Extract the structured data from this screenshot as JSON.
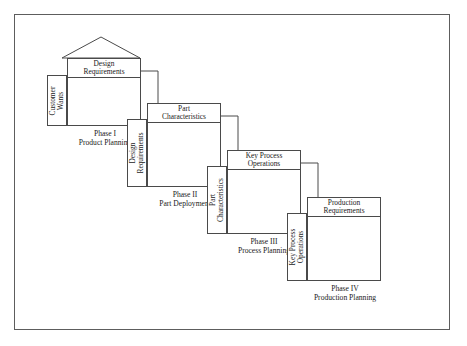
{
  "figure": {
    "border_color": "#5d5d5d",
    "line_color": "#4a4a4a",
    "background": "#ffffff",
    "text_color": "#1a1a1a"
  },
  "phases": [
    {
      "id": "phase-1",
      "output_label": "Design\nRequirements",
      "output_line1": "Design",
      "output_line2": "Requirements",
      "input_line1": "Customer",
      "input_line2": "Wants",
      "caption_line1": "Phase I",
      "caption_line2": "Product Planning",
      "has_roof": true
    },
    {
      "id": "phase-2",
      "output_label": "Part\nCharacteristics",
      "output_line1": "Part",
      "output_line2": "Characteristics",
      "input_line1": "Design",
      "input_line2": "Requirements",
      "caption_line1": "Phase II",
      "caption_line2": "Part Deployment",
      "has_roof": false
    },
    {
      "id": "phase-3",
      "output_label": "Key Process\nOperations",
      "output_line1": "Key Process",
      "output_line2": "Operations",
      "input_line1": "Part",
      "input_line2": "Characteristics",
      "caption_line1": "Phase III",
      "caption_line2": "Process Planning",
      "has_roof": false
    },
    {
      "id": "phase-4",
      "output_label": "Production\nRequirements",
      "output_line1": "Production",
      "output_line2": "Requirements",
      "input_line1": "Key Process",
      "input_line2": "Operations",
      "caption_line1": "Phase IV",
      "caption_line2": "Production Planning",
      "has_roof": false
    }
  ],
  "connectors": [
    {
      "id": "connector-1-to-2",
      "from": "phase-1",
      "to": "phase-2",
      "shape": "elbow-right-down",
      "arrowhead": "solid-down"
    },
    {
      "id": "connector-2-to-3",
      "from": "phase-2",
      "to": "phase-3",
      "shape": "elbow-right-down",
      "arrowhead": "solid-down"
    },
    {
      "id": "connector-3-to-4",
      "from": "phase-3",
      "to": "phase-4",
      "shape": "elbow-right-down",
      "arrowhead": "solid-down"
    }
  ]
}
